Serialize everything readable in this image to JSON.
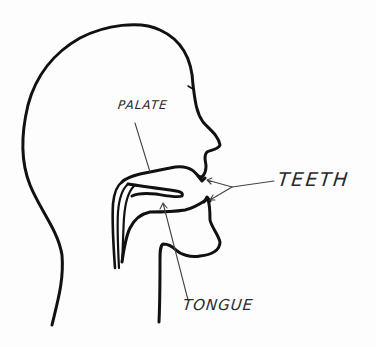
{
  "diagram": {
    "labels": {
      "palate": "PALATE",
      "teeth": "TEETH",
      "tongue": "TONGUE"
    },
    "colors": {
      "ink": "#111111",
      "pointer": "#444444",
      "text": "#2a2a2a",
      "paper": "#fdfdfd"
    }
  }
}
